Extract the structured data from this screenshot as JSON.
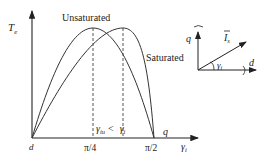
{
  "diagram": {
    "y_axis_label": "T",
    "y_axis_sub": "e",
    "curve_labels": {
      "unsaturated": "Unsaturated",
      "saturated": "Saturated"
    },
    "x_ticks": {
      "origin": "d",
      "quarter_pi": "π/4",
      "half_pi": "π/2"
    },
    "x_axis_label": "γ",
    "x_axis_sub": "i",
    "x_end_label": "q",
    "inequality": {
      "left": "γ",
      "left_sub": "iu",
      "op": "<",
      "right": "γ",
      "right_sub": "i"
    },
    "vector_diagram": {
      "q_label": "q",
      "d_label": "d",
      "current_label": "I",
      "current_sub": "s",
      "angle_label": "γ",
      "angle_sub": "i"
    }
  }
}
